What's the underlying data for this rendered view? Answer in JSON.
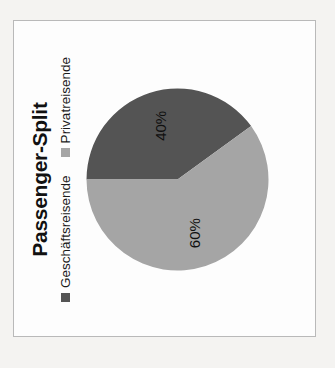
{
  "panel": {
    "background_color": "#fdfdfd",
    "border_color": "#b9b9b9"
  },
  "page": {
    "background_color": "#f4f3f1"
  },
  "chart_data": {
    "type": "pie",
    "title": "Passenger-Split",
    "subtitle": "",
    "xlabel": "",
    "ylabel": "",
    "grid": false,
    "legend_position": "top",
    "rotation_degrees": -90,
    "categories": [
      "Geschäftsreisende",
      "Privatreisende"
    ],
    "values": [
      40,
      60
    ],
    "data_labels": [
      "40%",
      "60%"
    ],
    "colors": [
      "#545454",
      "#a5a5a5"
    ],
    "slices": [
      {
        "label": "Geschäftsreisende",
        "value": 40,
        "data_label": "40%",
        "color": "#545454"
      },
      {
        "label": "Privatreisende",
        "value": 60,
        "data_label": "60%",
        "color": "#a5a5a5"
      }
    ],
    "legend": [
      {
        "label": "Geschäftsreisende",
        "color": "#545454"
      },
      {
        "label": "Privatreisende",
        "color": "#a5a5a5"
      }
    ]
  }
}
